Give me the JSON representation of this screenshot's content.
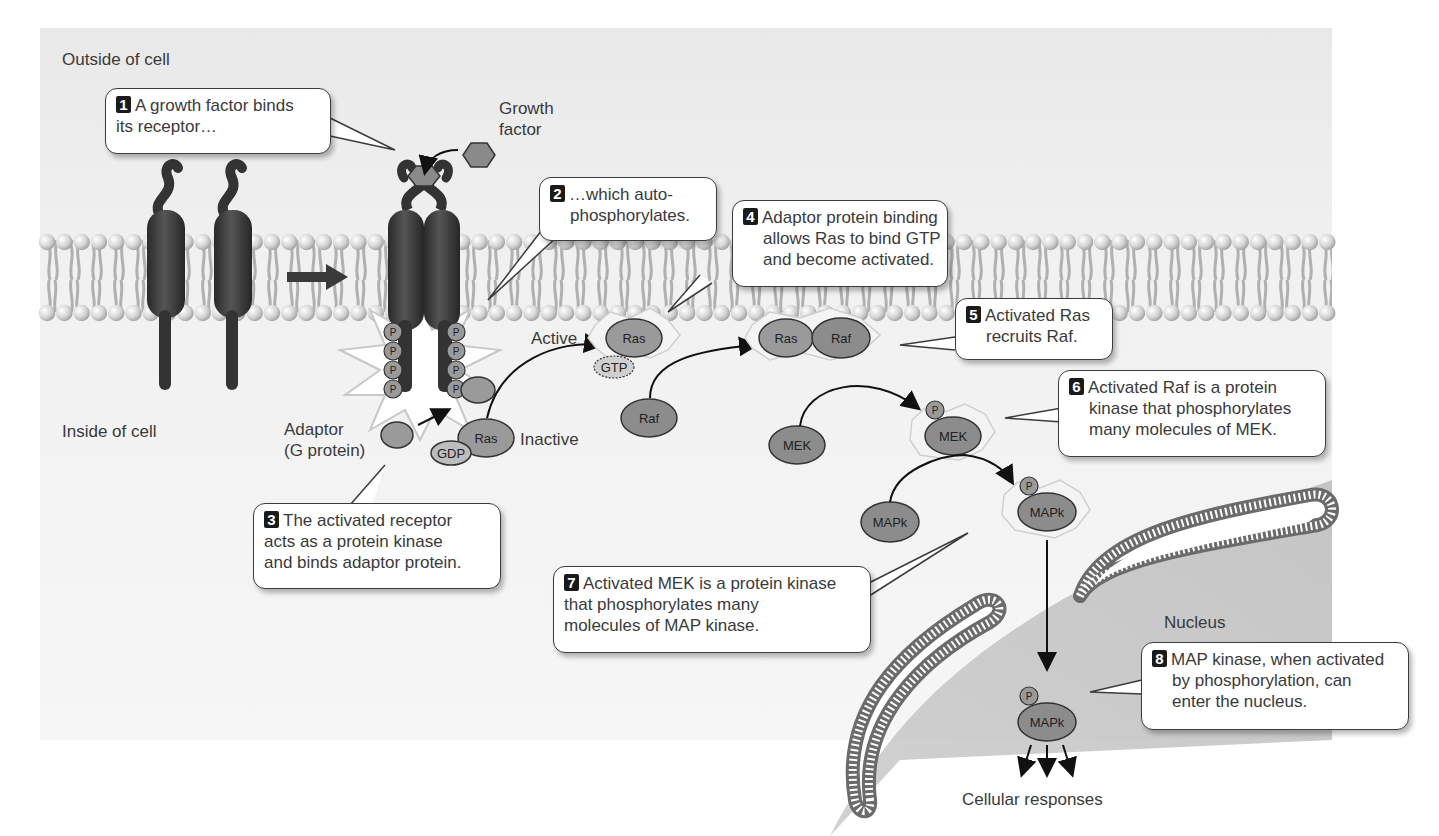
{
  "regions": {
    "outside": "Outside of cell",
    "inside": "Inside of cell",
    "nucleus": "Nucleus"
  },
  "labels": {
    "growth_factor_line1": "Growth",
    "growth_factor_line2": "factor",
    "adaptor_line1": "Adaptor",
    "adaptor_line2": "(G protein)",
    "active": "Active",
    "inactive": "Inactive",
    "cellular_responses": "Cellular responses"
  },
  "molecules": {
    "phosphate": "P",
    "ras": "Ras",
    "raf": "Raf",
    "gtp": "GTP",
    "gdp": "GDP",
    "mek": "MEK",
    "mapk": "MAPk"
  },
  "steps": [
    {
      "num": "1",
      "lines": [
        "A growth factor binds",
        "its receptor…"
      ]
    },
    {
      "num": "2",
      "lines": [
        "…which auto-",
        "phosphorylates."
      ]
    },
    {
      "num": "3",
      "lines": [
        "The activated receptor",
        "acts as a protein kinase",
        "and binds adaptor protein."
      ]
    },
    {
      "num": "4",
      "lines": [
        "Adaptor protein binding",
        "allows Ras to bind GTP",
        "and become activated."
      ]
    },
    {
      "num": "5",
      "lines": [
        "Activated Ras",
        "recruits Raf."
      ]
    },
    {
      "num": "6",
      "lines": [
        "Activated Raf is a protein",
        "kinase that phosphorylates",
        "many molecules of MEK."
      ]
    },
    {
      "num": "7",
      "lines": [
        "Activated MEK is a protein kinase",
        "that phosphorylates many",
        "molecules of MAP kinase."
      ]
    },
    {
      "num": "8",
      "lines": [
        "MAP kinase, when activated",
        "by phosphorylation, can",
        "enter the nucleus."
      ]
    }
  ],
  "colors": {
    "background": "#f3f3f3",
    "receptor": "#3a3a3a",
    "protein_fill": "#8c8c8c",
    "lipid_head": "#d9d9d9",
    "lipid_tail": "#b3b3b3",
    "nucleus_shade": "#c8c8c8",
    "callout_badge": "#1a1a1a"
  }
}
